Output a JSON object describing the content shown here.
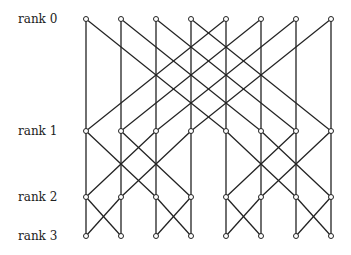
{
  "colors": {
    "line": "#222222",
    "background": "#ffffff",
    "node_fill": "#ffffff"
  },
  "ranks": [
    {
      "label": "rank 0",
      "y": 19
    },
    {
      "label": "rank 1",
      "y": 131
    },
    {
      "label": "rank 2",
      "y": 197
    },
    {
      "label": "rank 3",
      "y": 236
    }
  ],
  "columns_x": [
    86,
    121,
    156,
    191,
    226,
    261,
    296,
    331
  ],
  "strides": [
    4,
    2,
    1
  ],
  "node_radius": 2.5,
  "label_x": 18
}
